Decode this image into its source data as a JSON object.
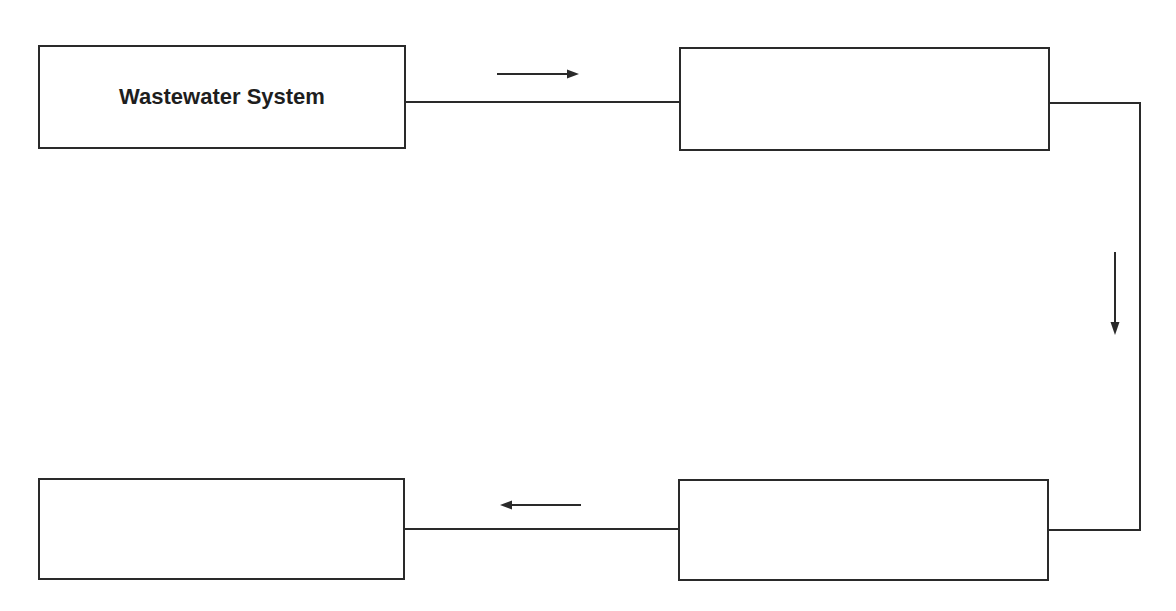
{
  "diagram": {
    "type": "flow-cycle",
    "boxes": [
      {
        "id": "box1",
        "label": "Wastewater System"
      },
      {
        "id": "box2",
        "label": ""
      },
      {
        "id": "box3",
        "label": ""
      },
      {
        "id": "box4",
        "label": ""
      }
    ],
    "flow": [
      {
        "from": "box1",
        "to": "box2",
        "direction": "right"
      },
      {
        "from": "box2",
        "to": "box3",
        "direction": "down"
      },
      {
        "from": "box3",
        "to": "box4",
        "direction": "left"
      }
    ],
    "colors": {
      "line": "#2a2a2a",
      "background": "#ffffff"
    }
  }
}
